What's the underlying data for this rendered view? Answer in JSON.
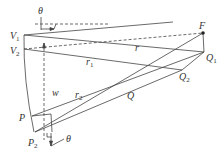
{
  "diagram": {
    "labels": {
      "theta_top": "θ",
      "theta_bottom": "θ",
      "V1": "V",
      "V1_sub": "1",
      "V2": "V",
      "V2_sub": "2",
      "F": "F",
      "Q1": "Q",
      "Q1_sub": "1",
      "Q2": "Q",
      "Q2_sub": "2",
      "Q": "Q",
      "P": "P",
      "P2": "P",
      "P2_sub": "2",
      "r": "r",
      "r1": "r",
      "r1_sub": "1",
      "r2": "r",
      "r2_sub": "2",
      "w": "w"
    },
    "colors": {
      "line": "#444444",
      "text": "#333333",
      "background": "#ffffff"
    }
  }
}
